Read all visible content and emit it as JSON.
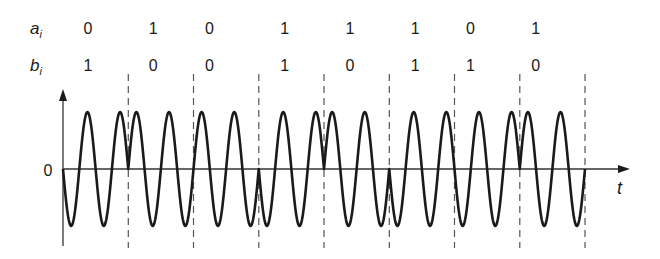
{
  "diagram": {
    "title": "",
    "rows": {
      "a": {
        "label": "a",
        "subscript": "i"
      },
      "b": {
        "label": "b",
        "subscript": "i"
      }
    },
    "a_bits": [
      "0",
      "1",
      "0",
      "1",
      "1",
      "1",
      "0",
      "1"
    ],
    "b_bits": [
      "1",
      "0",
      "0",
      "1",
      "0",
      "1",
      "1",
      "0"
    ],
    "axis": {
      "origin_label": "0",
      "x_label": "t",
      "y_label": ""
    },
    "waveform": {
      "cycles_per_symbol": 2,
      "symbol_signs": [
        -1,
        1,
        1,
        -1,
        1,
        -1,
        -1,
        1
      ]
    },
    "colors": {
      "wave": "#1a1a1a",
      "axis": "#333333",
      "dashed": "#555555",
      "text": "#1a1a1a"
    }
  },
  "layout": {
    "origin_x": 63,
    "zero_y": 169,
    "symbol_width": 65.25,
    "amplitude": 57,
    "a_row_y": 34,
    "b_row_y": 71,
    "label_offsets": [
      25,
      25,
      16,
      26,
      26,
      26,
      16,
      16
    ]
  }
}
